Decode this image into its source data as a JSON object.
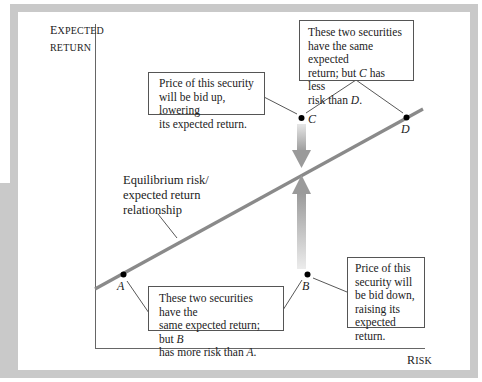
{
  "axes": {
    "y_label_line1_first": "E",
    "y_label_line1_rest": "XPECTED",
    "y_label_line2": "RETURN",
    "x_label_first": "R",
    "x_label_rest": "ISK"
  },
  "line_label": {
    "line1": "Equilibrium risk/",
    "line2": "expected return",
    "line3": "relationship"
  },
  "points": {
    "A": "A",
    "B": "B",
    "C": "C",
    "D": "D"
  },
  "callouts": {
    "cd": {
      "line1": "These two securities",
      "line2": "have the same expected",
      "line3_pre": "return; but ",
      "line3_var": "C",
      "line3_post": " has less",
      "line4_pre": "risk than ",
      "line4_var": "D",
      "line4_post": "."
    },
    "c": {
      "line1": "Price of this security",
      "line2": "will be bid up, lowering",
      "line3": "its expected return."
    },
    "ab": {
      "line1": "These two securities have the",
      "line2_pre": "same expected return; but ",
      "line2_var": "B",
      "line3_pre": "has more risk than ",
      "line3_var": "A",
      "line3_post": "."
    },
    "b": {
      "line1": "Price of this",
      "line2": "security will",
      "line3": "be bid down,",
      "line4": "raising its",
      "line5": "expected return."
    }
  },
  "colors": {
    "frame": "#c9c9c9",
    "line": "#8a8a8a",
    "arrow": "#a0a0a0"
  }
}
